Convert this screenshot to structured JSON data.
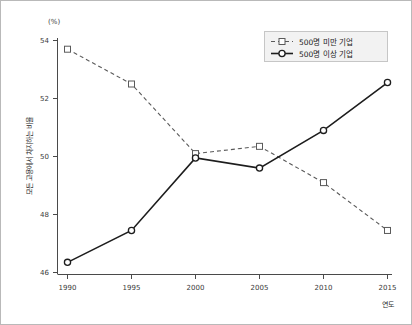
{
  "figure": {
    "background": "#ffffff",
    "border_color": "#b8b8b8"
  },
  "chart_data": {
    "type": "line",
    "title": "",
    "subtitle": "",
    "xlabel": "연도",
    "ylabel": "모든 고용에서 차지하는 비율",
    "yunit": "(%)",
    "categories": [
      "1990",
      "1995",
      "2000",
      "2005",
      "2010",
      "2015"
    ],
    "x": [
      1990,
      1995,
      2000,
      2005,
      2010,
      2015
    ],
    "xlim": [
      1988.5,
      2016.5
    ],
    "ylim": [
      46,
      54
    ],
    "yticks": [
      46,
      48,
      50,
      52,
      54
    ],
    "xticks": [
      1990,
      1995,
      2000,
      2005,
      2010,
      2015
    ],
    "grid": false,
    "legend_position": "top-right",
    "series": [
      {
        "name": "500명 미만 기업",
        "values": [
          53.7,
          52.5,
          50.1,
          50.35,
          49.1,
          47.45
        ],
        "line_style": "dashed",
        "marker": "square",
        "color": "#555555"
      },
      {
        "name": "500명 이상 기업",
        "values": [
          46.35,
          47.45,
          49.95,
          49.6,
          50.9,
          52.55
        ],
        "line_style": "solid",
        "marker": "circle",
        "color": "#1a1a1a"
      }
    ]
  },
  "legend": {
    "entries": [
      {
        "label": "500명 미만 기업",
        "style": "dashed-square"
      },
      {
        "label": "500명 이상 기업",
        "style": "solid-circle"
      }
    ]
  },
  "axes": {
    "y_unit_text": "(%)",
    "y_title_text": "모든 고용에서 차지하는 비율",
    "x_title_text": "연도",
    "y_tick_texts": [
      "54",
      "52",
      "50",
      "48",
      "46"
    ],
    "x_tick_texts": [
      "1990",
      "1995",
      "2000",
      "2005",
      "2010",
      "2015"
    ]
  }
}
